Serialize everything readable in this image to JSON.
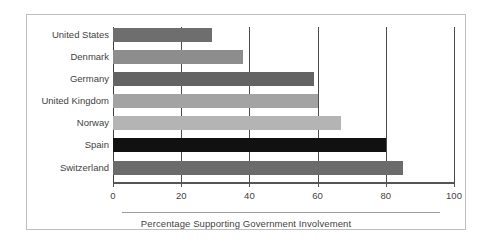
{
  "figure": {
    "background_color": "#ffffff",
    "border_color": "#bdbdbd"
  },
  "chart_data": {
    "type": "bar",
    "orientation": "horizontal",
    "title": "",
    "subtitle": "",
    "xlabel": "Percentage Supporting Government Involvement",
    "ylabel": "",
    "categories": [
      "United States",
      "Denmark",
      "Germany",
      "United Kingdom",
      "Norway",
      "Spain",
      "Switzerland"
    ],
    "values": [
      29,
      38,
      59,
      60,
      67,
      80,
      85
    ],
    "bar_colors": [
      "#6e6e6e",
      "#8d8d8d",
      "#636363",
      "#a3a3a3",
      "#b4b4b4",
      "#111111",
      "#6b6b6b"
    ],
    "xlim": [
      0,
      100
    ],
    "xticks": [
      0,
      20,
      40,
      60,
      80,
      100
    ],
    "xticklabels": [
      "0",
      "20",
      "40",
      "60",
      "80",
      "100"
    ],
    "grid": true,
    "grid_orientation": "vertical",
    "legend": null,
    "legend_position": "none",
    "annotations": []
  }
}
